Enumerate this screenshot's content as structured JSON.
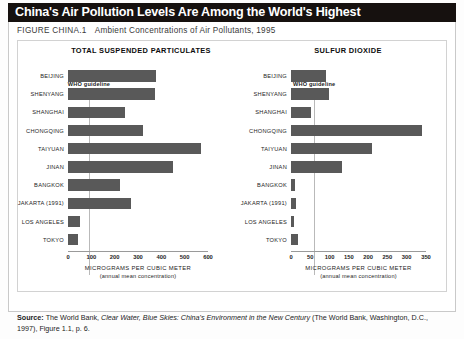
{
  "header": {
    "title": "China's Air Pollution Levels Are Among the World's Highest",
    "figure_number": "FIGURE CHINA.1",
    "figure_caption": "Ambient Concentrations of Air Pollutants, 1995"
  },
  "source": {
    "label": "Source:",
    "text_1": "The World Bank,",
    "italic_1": "Clear Water, Blue Skies: China's Environment in the New Century",
    "text_2": "(The World Bank, Washington, D.C., 1997), Figure 1.1, p. 6."
  },
  "colors": {
    "bar": "#595959",
    "title_bar_bg": "#16110f",
    "title_bar_text": "#ffffff",
    "guideline": "#b9b9b9",
    "axis": "#9a9a9a",
    "panel_border": "#d2d2d2"
  },
  "chart_data": [
    {
      "type": "bar",
      "orientation": "horizontal",
      "title": "TOTAL SUSPENDED PARTICULATES",
      "xlabel": "MICROGRAMS PER CUBIC METER",
      "xlabel_sub": "(annual mean concentration)",
      "ylabel": "",
      "xlim": [
        0,
        600
      ],
      "xticks": [
        0,
        100,
        200,
        300,
        400,
        500,
        600
      ],
      "xticklabels": [
        "0",
        "100",
        "200",
        "300",
        "400",
        "500",
        "600"
      ],
      "grid": false,
      "legend": "none",
      "annotations": [
        {
          "label": "WHO guideline",
          "value": 90,
          "kind": "vertical-line"
        }
      ],
      "categories": [
        "BEIJING",
        "SHENYANG",
        "SHANGHAI",
        "CHONGQING",
        "TAIYUAN",
        "JINAN",
        "BANGKOK",
        "JAKARTA (1991)",
        "LOS ANGELES",
        "TOKYO"
      ],
      "values": [
        377,
        374,
        246,
        320,
        568,
        450,
        223,
        271,
        50,
        43
      ]
    },
    {
      "type": "bar",
      "orientation": "horizontal",
      "title": "SULFUR DIOXIDE",
      "xlabel": "MICROGRAMS PER CUBIC METER",
      "xlabel_sub": "(annual mean concentration)",
      "ylabel": "",
      "xlim": [
        0,
        350
      ],
      "xticks": [
        0,
        50,
        100,
        150,
        200,
        250,
        300,
        350
      ],
      "xticklabels": [
        "0",
        "50",
        "100",
        "150",
        "200",
        "250",
        "300",
        "350"
      ],
      "grid": false,
      "legend": "none",
      "annotations": [
        {
          "label": "WHO guideline",
          "value": 60,
          "kind": "vertical-line"
        }
      ],
      "categories": [
        "BEIJING",
        "SHENYANG",
        "SHANGHAI",
        "CHONGQING",
        "TAIYUAN",
        "JINAN",
        "BANGKOK",
        "JAKARTA (1991)",
        "LOS ANGELES",
        "TOKYO"
      ],
      "values": [
        90,
        99,
        53,
        340,
        211,
        132,
        11,
        14,
        9,
        18
      ]
    }
  ]
}
